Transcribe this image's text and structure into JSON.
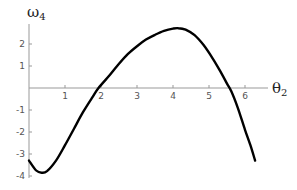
{
  "chart_data": {
    "type": "line",
    "title": "",
    "xlabel": "θ2",
    "ylabel": "ω4",
    "xlim": [
      0,
      6.4
    ],
    "ylim": [
      -4,
      2.8
    ],
    "x_ticks": [
      1,
      2,
      3,
      4,
      5,
      6
    ],
    "y_ticks": [
      -4,
      -3,
      -2,
      -1,
      1,
      2
    ],
    "grid": false,
    "legend": null,
    "series": [
      {
        "name": "ω4",
        "color": "#000000",
        "x": [
          0.0,
          0.2,
          0.35,
          0.5,
          0.75,
          1.0,
          1.25,
          1.5,
          1.75,
          1.93,
          2.25,
          2.5,
          2.75,
          3.0,
          3.25,
          3.5,
          3.75,
          4.0,
          4.15,
          4.35,
          4.6,
          4.85,
          5.1,
          5.3,
          5.5,
          5.62,
          5.8,
          6.0,
          6.15,
          6.28
        ],
        "values": [
          -3.3,
          -3.75,
          -3.85,
          -3.78,
          -3.3,
          -2.6,
          -1.85,
          -1.1,
          -0.45,
          0.0,
          0.6,
          1.1,
          1.55,
          1.9,
          2.2,
          2.42,
          2.6,
          2.7,
          2.72,
          2.65,
          2.4,
          1.95,
          1.35,
          0.8,
          0.2,
          -0.15,
          -0.9,
          -1.9,
          -2.6,
          -3.3
        ]
      }
    ]
  },
  "labels": {
    "y_axis_main": "ω",
    "y_axis_sub": "4",
    "x_axis_main": "θ",
    "x_axis_sub": "2"
  }
}
